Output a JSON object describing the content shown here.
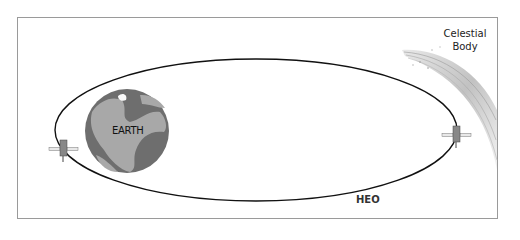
{
  "diagram": {
    "labels": {
      "earth": "EARTH",
      "celestial_line1": "Celestial",
      "celestial_line2": "Body",
      "orbit": "HEO"
    },
    "colors": {
      "frame": "#9a9a9a",
      "orbit": "#111111",
      "earth_ocean": "#6e6e6e",
      "earth_land": "#a8a8a8",
      "comet": "#bdbdbd"
    },
    "icons": {
      "earth": "globe-icon",
      "satellite_left": "satellite-icon",
      "satellite_right": "satellite-icon",
      "comet": "comet-icon"
    }
  }
}
